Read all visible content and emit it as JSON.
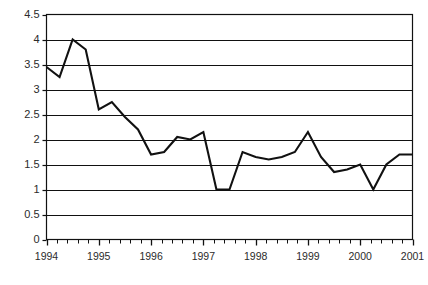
{
  "chart_data": {
    "type": "line",
    "title": "",
    "subtitle": "",
    "xlabel": "",
    "ylabel": "",
    "grid": true,
    "legend": null,
    "legend_position": "none",
    "ylim": [
      0,
      4.5
    ],
    "xlim": [
      1994,
      2001
    ],
    "y_ticks": [
      "0",
      "0.5",
      "1",
      "1.5",
      "2",
      "2.5",
      "3",
      "3.5",
      "4",
      "4.5"
    ],
    "y_tick_values": [
      0,
      0.5,
      1,
      1.5,
      2,
      2.5,
      3,
      3.5,
      4,
      4.5
    ],
    "x_ticks": [
      "1994",
      "1995",
      "1996",
      "1997",
      "1998",
      "1999",
      "2000",
      "2001"
    ],
    "x_tick_values": [
      1994,
      1995,
      1996,
      1997,
      1998,
      1999,
      2000,
      2001
    ],
    "minor_ticks_per_interval": 4,
    "series": [
      {
        "name": "series-1",
        "color": "#111111",
        "x": [
          1994.0,
          1994.25,
          1994.5,
          1994.75,
          1995.0,
          1995.25,
          1995.5,
          1995.75,
          1996.0,
          1996.25,
          1996.5,
          1996.75,
          1997.0,
          1997.25,
          1997.5,
          1997.75,
          1998.0,
          1998.25,
          1998.5,
          1998.75,
          1999.0,
          1999.25,
          1999.5,
          1999.75,
          2000.0,
          2000.25,
          2000.5,
          2000.75,
          2001.0
        ],
        "values": [
          3.45,
          3.25,
          4.0,
          3.8,
          2.6,
          2.75,
          2.45,
          2.2,
          1.7,
          1.75,
          2.05,
          2.0,
          2.15,
          1.0,
          1.0,
          1.75,
          1.65,
          1.6,
          1.65,
          1.75,
          2.15,
          1.65,
          1.35,
          1.4,
          1.5,
          1.0,
          1.5,
          1.7,
          1.7
        ]
      }
    ]
  }
}
